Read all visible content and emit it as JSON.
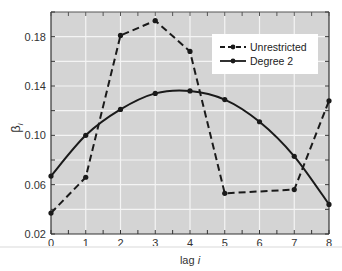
{
  "chart_data": {
    "type": "line",
    "title": "",
    "xlabel": "lag i",
    "ylabel": "βi",
    "xlim": [
      0,
      8
    ],
    "ylim": [
      0.02,
      0.2
    ],
    "x_ticks": [
      0,
      1,
      2,
      3,
      4,
      5,
      6,
      7,
      8
    ],
    "y_ticks": [
      0.02,
      0.06,
      0.1,
      0.14,
      0.18
    ],
    "y_tick_labels": [
      "0.02",
      "0.06",
      "0.10",
      "0.14",
      "0.18"
    ],
    "grid": true,
    "legend_position": "upper right",
    "series": [
      {
        "name": "Unrestricted",
        "style": "dashed",
        "x": [
          0,
          1,
          2,
          3,
          4,
          5,
          7,
          8
        ],
        "values": [
          0.037,
          0.066,
          0.181,
          0.193,
          0.168,
          0.053,
          0.056,
          0.128
        ]
      },
      {
        "name": "Degree 2",
        "style": "solid",
        "x": [
          0,
          1,
          2,
          3,
          4,
          5,
          6,
          7,
          8
        ],
        "values": [
          0.067,
          0.1,
          0.121,
          0.134,
          0.136,
          0.129,
          0.111,
          0.083,
          0.044
        ]
      }
    ]
  },
  "colors": {
    "plot_background": "#d4d4d4",
    "grid": "#f4f4f4",
    "line": "#1a1a1a",
    "legend_background": "#ffffff"
  }
}
